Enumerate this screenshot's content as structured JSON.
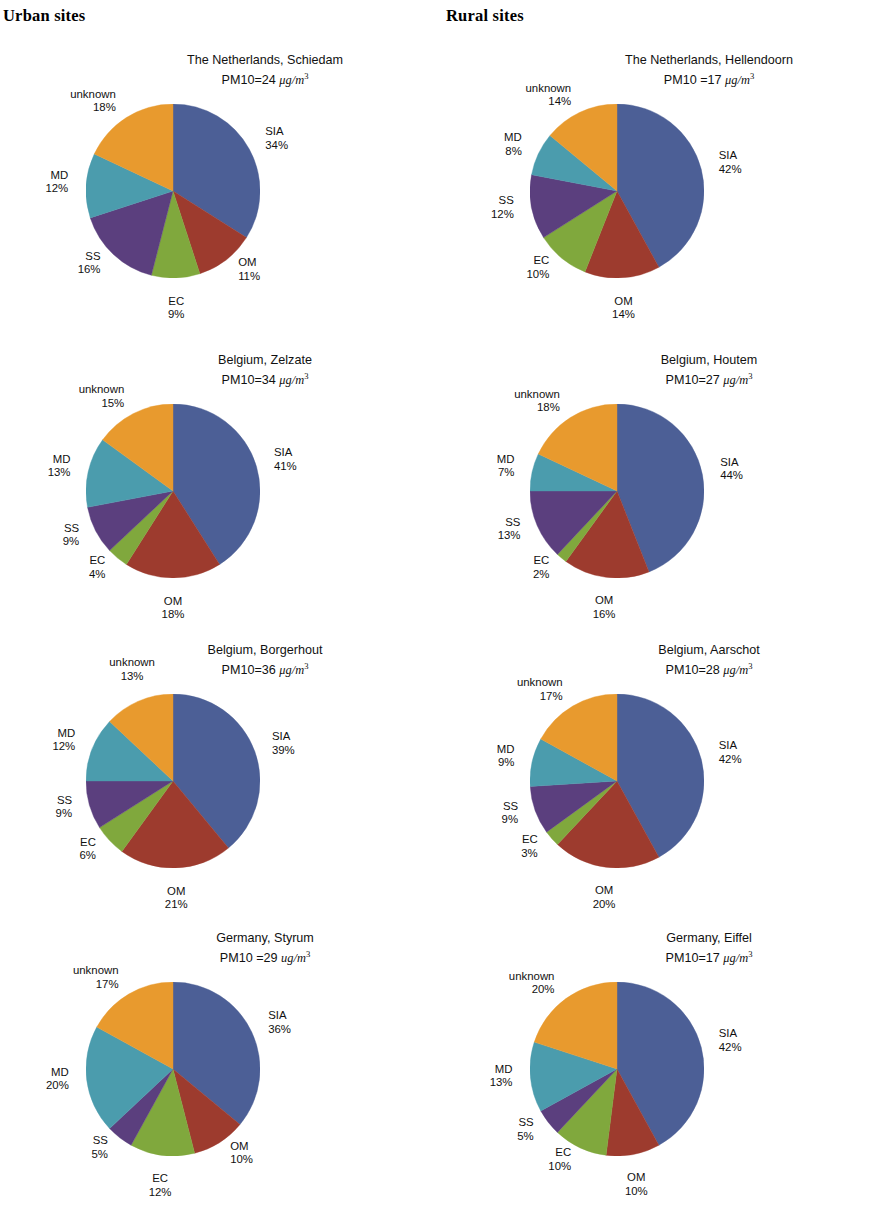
{
  "headers": {
    "urban": "Urban sites",
    "rural": "Rural sites"
  },
  "legend_keys": [
    "SIA",
    "OM",
    "EC",
    "SS",
    "MD",
    "unknown"
  ],
  "colors": {
    "SIA": "#4c5f96",
    "OM": "#9d3b2e",
    "EC": "#80a83d",
    "SS": "#5b3f7e",
    "MD": "#4b9cad",
    "unknown": "#e89a2e",
    "background": "#ffffff",
    "text": "#111111"
  },
  "chart_data": [
    {
      "id": "schiedam",
      "column": "urban",
      "row": 0,
      "type": "pie",
      "title": "The Netherlands, Schiedam",
      "subtitle_prefix": "PM10=",
      "pm10_value": "24",
      "unit_mu": "μg/m",
      "unit_exp": "3",
      "categories": [
        "SIA",
        "OM",
        "EC",
        "SS",
        "MD",
        "unknown"
      ],
      "values": [
        34,
        11,
        9,
        16,
        12,
        18
      ],
      "labels": [
        "SIA",
        "OM",
        "EC",
        "SS",
        "MD",
        "unknown"
      ],
      "pct_labels": [
        "34%",
        "11%",
        "9%",
        "16%",
        "12%",
        "18%"
      ]
    },
    {
      "id": "hellendoorn",
      "column": "rural",
      "row": 0,
      "type": "pie",
      "title": "The Netherlands, Hellendoorn",
      "subtitle_prefix": "PM10 =",
      "pm10_value": "17",
      "unit_mu": "μg/m",
      "unit_exp": "3",
      "categories": [
        "SIA",
        "OM",
        "EC",
        "SS",
        "MD",
        "unknown"
      ],
      "values": [
        42,
        14,
        10,
        12,
        8,
        14
      ],
      "labels": [
        "SIA",
        "OM",
        "EC",
        "SS",
        "MD",
        "unknown"
      ],
      "pct_labels": [
        "42%",
        "14%",
        "10%",
        "12%",
        "8%",
        "14%"
      ]
    },
    {
      "id": "zelzate",
      "column": "urban",
      "row": 1,
      "type": "pie",
      "title": "Belgium, Zelzate",
      "subtitle_prefix": "PM10=",
      "pm10_value": "34",
      "unit_mu": "μg/m",
      "unit_exp": "3",
      "categories": [
        "SIA",
        "OM",
        "EC",
        "SS",
        "MD",
        "unknown"
      ],
      "values": [
        41,
        18,
        4,
        9,
        13,
        15
      ],
      "labels": [
        "SIA",
        "OM",
        "EC",
        "SS",
        "MD",
        "unknown"
      ],
      "pct_labels": [
        "41%",
        "18%",
        "4%",
        "9%",
        "13%",
        "15%"
      ]
    },
    {
      "id": "houtem",
      "column": "rural",
      "row": 1,
      "type": "pie",
      "title": "Belgium, Houtem",
      "subtitle_prefix": "PM10=",
      "pm10_value": "27",
      "unit_mu": "μg/m",
      "unit_exp": "3",
      "categories": [
        "SIA",
        "OM",
        "EC",
        "SS",
        "MD",
        "unknown"
      ],
      "values": [
        44,
        16,
        2,
        13,
        7,
        18
      ],
      "labels": [
        "SIA",
        "OM",
        "EC",
        "SS",
        "MD",
        "unknown"
      ],
      "pct_labels": [
        "44%",
        "16%",
        "2%",
        "13%",
        "7%",
        "18%"
      ]
    },
    {
      "id": "borgerhout",
      "column": "urban",
      "row": 2,
      "type": "pie",
      "title": "Belgium, Borgerhout",
      "subtitle_prefix": "PM10=",
      "pm10_value": "36",
      "unit_mu": "μg/m",
      "unit_exp": "3",
      "categories": [
        "SIA",
        "OM",
        "EC",
        "SS",
        "MD",
        "unknown"
      ],
      "values": [
        39,
        21,
        6,
        9,
        12,
        13
      ],
      "labels": [
        "SIA",
        "OM",
        "EC",
        "SS",
        "MD",
        "unknown"
      ],
      "pct_labels": [
        "39%",
        "21%",
        "6%",
        "9%",
        "12%",
        "13%"
      ]
    },
    {
      "id": "aarschot",
      "column": "rural",
      "row": 2,
      "type": "pie",
      "title": "Belgium, Aarschot",
      "subtitle_prefix": "PM10=",
      "pm10_value": "28",
      "unit_mu": "μg/m",
      "unit_exp": "3",
      "categories": [
        "SIA",
        "OM",
        "EC",
        "SS",
        "MD",
        "unknown"
      ],
      "values": [
        42,
        20,
        3,
        9,
        9,
        17
      ],
      "labels": [
        "SIA",
        "OM",
        "EC",
        "SS",
        "MD",
        "unknown"
      ],
      "pct_labels": [
        "42%",
        "20%",
        "3%",
        "9%",
        "9%",
        "17%"
      ]
    },
    {
      "id": "styrum",
      "column": "urban",
      "row": 3,
      "type": "pie",
      "title": "Germany, Styrum",
      "subtitle_prefix": "PM10 =",
      "pm10_value": "29",
      "unit_mu": "ug/m",
      "unit_exp": "3",
      "categories": [
        "SIA",
        "OM",
        "EC",
        "SS",
        "MD",
        "unknown"
      ],
      "values": [
        36,
        10,
        12,
        5,
        20,
        17
      ],
      "labels": [
        "SIA",
        "OM",
        "EC",
        "SS",
        "MD",
        "unknown"
      ],
      "pct_labels": [
        "36%",
        "10%",
        "12%",
        "5%",
        "20%",
        "17%"
      ]
    },
    {
      "id": "eiffel",
      "column": "rural",
      "row": 3,
      "type": "pie",
      "title": "Germany, Eiffel",
      "subtitle_prefix": "PM10=",
      "pm10_value": "17",
      "unit_mu": "μg/m",
      "unit_exp": "3",
      "categories": [
        "SIA",
        "OM",
        "EC",
        "SS",
        "MD",
        "unknown"
      ],
      "values": [
        42,
        10,
        10,
        5,
        13,
        20
      ],
      "labels": [
        "SIA",
        "OM",
        "EC",
        "SS",
        "MD",
        "unknown"
      ],
      "pct_labels": [
        "42%",
        "10%",
        "10%",
        "5%",
        "13%",
        "20%"
      ]
    }
  ]
}
